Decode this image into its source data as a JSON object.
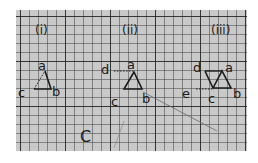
{
  "diagram": {
    "background": "graph paper",
    "colors": {
      "paper": "#c9c9c9",
      "grid": "#2a2a2a",
      "ink": "#1a1a1a",
      "page": "#ffffff"
    },
    "figures": [
      {
        "id": "i",
        "caption": "(i)",
        "vertices": [
          "a",
          "b",
          "c"
        ],
        "description": "small triangle a-b-c with dotted line from c to a"
      },
      {
        "id": "ii",
        "caption": "(ii)",
        "vertices": [
          "d",
          "a",
          "b",
          "c"
        ],
        "description": "triangle a-b-c with dotted line from a to d"
      },
      {
        "id": "iii",
        "caption": "(iii)",
        "vertices": [
          "d",
          "a",
          "e",
          "c",
          "b"
        ],
        "description": "two triangles d-c-a and a-c-b with dotted line from c to e"
      }
    ],
    "loose_label": "C",
    "labels": {
      "fig1_caption": "(i)",
      "fig2_caption": "(ii)",
      "fig3_caption": "(iii)",
      "a": "a",
      "b": "b",
      "c": "c",
      "d": "d",
      "e": "e",
      "big_c": "C"
    }
  }
}
